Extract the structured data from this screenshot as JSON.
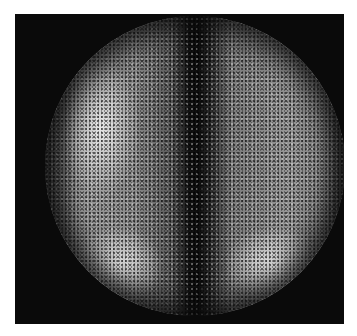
{
  "image": {
    "type": "grayscale scintigraphy (gamma camera) image",
    "description": "Circular field of view on black background showing speckled gray activity with a dark vertical midline band, a bright elongated region on the upper left, and two bright lobes at the lower left and lower right.",
    "colors": {
      "background": "#ffffff",
      "frame": "#0a0a0a",
      "bright_region": "#ebebeb",
      "mid_gray": "#8a8a8a",
      "midline": "#0c0c0c"
    }
  }
}
